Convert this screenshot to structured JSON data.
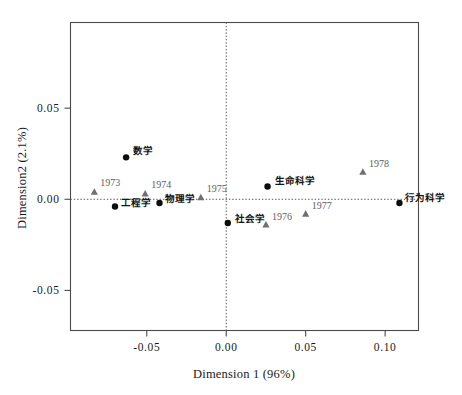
{
  "chart_data": {
    "type": "scatter",
    "title": "",
    "xlabel": "Dimension 1 (96%)",
    "ylabel": "Dimension2 (2.1%)",
    "xlim": [
      -0.098,
      0.121
    ],
    "ylim": [
      -0.072,
      0.097
    ],
    "xticks": [
      "-0.05",
      "0.00",
      "0.05",
      "0.10"
    ],
    "xtick_values": [
      -0.05,
      0.0,
      0.05,
      0.1
    ],
    "yticks": [
      "0.05",
      "0.00",
      "-0.05"
    ],
    "ytick_values": [
      0.05,
      0.0,
      -0.05
    ],
    "grid": false,
    "reference_lines": {
      "vertical_x": 0.0,
      "horizontal_y": 0.0,
      "style": "dotted"
    },
    "legend": "none",
    "series": [
      {
        "name": "disciplines",
        "marker": "circle",
        "color": "#0d0d0d",
        "points": [
          {
            "label": "工程学",
            "x": -0.07,
            "y": -0.004,
            "label_dx": 6,
            "label_dy": -1
          },
          {
            "label": "数学",
            "x": -0.063,
            "y": 0.023,
            "label_dx": 7,
            "label_dy": -3
          },
          {
            "label": "物理学",
            "x": -0.042,
            "y": -0.002,
            "label_dx": 6,
            "label_dy": -1
          },
          {
            "label": "社会学",
            "x": 0.001,
            "y": -0.013,
            "label_dx": 7,
            "label_dy": -1
          },
          {
            "label": "生命科学",
            "x": 0.026,
            "y": 0.007,
            "label_dx": 7,
            "label_dy": -3
          },
          {
            "label": "行为科学",
            "x": 0.109,
            "y": -0.002,
            "label_dx": 6,
            "label_dy": -2
          }
        ]
      },
      {
        "name": "years",
        "marker": "triangle",
        "color": "#6f6f6f",
        "points": [
          {
            "label": "1973",
            "x": -0.083,
            "y": 0.004,
            "label_dx": 6,
            "label_dy": -6
          },
          {
            "label": "1974",
            "x": -0.051,
            "y": 0.003,
            "label_dx": 6,
            "label_dy": -6
          },
          {
            "label": "1975",
            "x": -0.016,
            "y": 0.001,
            "label_dx": 6,
            "label_dy": -5
          },
          {
            "label": "1976",
            "x": 0.025,
            "y": -0.014,
            "label_dx": 6,
            "label_dy": -5
          },
          {
            "label": "1977",
            "x": 0.05,
            "y": -0.008,
            "label_dx": 6,
            "label_dy": -5
          },
          {
            "label": "1978",
            "x": 0.086,
            "y": 0.015,
            "label_dx": 6,
            "label_dy": -5
          }
        ]
      }
    ]
  },
  "colors": {
    "frame": "#4a4a4a",
    "circle_marker": "#0d0d0d",
    "triangle_marker": "#6f6f6f",
    "reference_line": "#555555",
    "background": "#ffffff"
  }
}
